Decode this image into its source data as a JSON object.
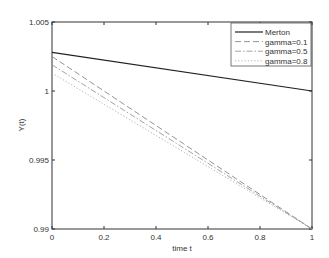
{
  "chart_data": {
    "type": "line",
    "title": "",
    "xlabel": "time t",
    "ylabel": "Y(t)",
    "xlim": [
      0,
      1
    ],
    "ylim": [
      0.99,
      1.005
    ],
    "xticks": [
      0,
      0.2,
      0.4,
      0.6,
      0.8,
      1
    ],
    "xtick_labels": [
      "0",
      "0.2",
      "0.4",
      "0.6",
      "0.8",
      "1"
    ],
    "yticks": [
      0.99,
      0.995,
      1,
      1.005
    ],
    "ytick_labels": [
      "0.99",
      "0.995",
      "1",
      "1.005"
    ],
    "grid": false,
    "legend_position": "upper right",
    "x": [
      0,
      1
    ],
    "series": [
      {
        "name": "Merton",
        "values": [
          1.0028,
          1.0
        ],
        "style": "solid",
        "color": "#222222"
      },
      {
        "name": "gamma=0.1",
        "values": [
          1.0025,
          0.99
        ],
        "style": "dashed",
        "color": "#888888"
      },
      {
        "name": "gamma=0.5",
        "values": [
          1.0019,
          0.99
        ],
        "style": "dashdot",
        "color": "#999999"
      },
      {
        "name": "gamma=0.8",
        "values": [
          1.0013,
          0.99
        ],
        "style": "dotted",
        "color": "#aaaaaa"
      }
    ]
  }
}
